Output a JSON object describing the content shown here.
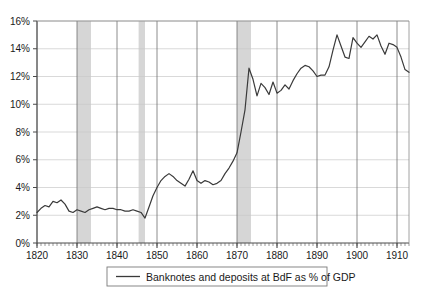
{
  "chart_data": {
    "type": "line",
    "title": "",
    "xlabel": "",
    "ylabel": "",
    "xlim": [
      1820,
      1913
    ],
    "ylim": [
      0,
      16
    ],
    "grid": true,
    "legend_position": "bottom",
    "y_ticks": [
      "0%",
      "2%",
      "4%",
      "6%",
      "8%",
      "10%",
      "12%",
      "14%",
      "16%"
    ],
    "y_tick_values": [
      0,
      2,
      4,
      6,
      8,
      10,
      12,
      14,
      16
    ],
    "x_ticks": [
      "1820",
      "1830",
      "1840",
      "1850",
      "1860",
      "1870",
      "1880",
      "1890",
      "1900",
      "1910"
    ],
    "x_tick_values": [
      1820,
      1830,
      1840,
      1850,
      1860,
      1870,
      1880,
      1890,
      1900,
      1910
    ],
    "x_minor_tick_step": 1,
    "series": [
      {
        "name": "Banknotes and deposits at BdF as % of GDP",
        "color": "#3a3a3a",
        "x": [
          1820,
          1821,
          1822,
          1823,
          1824,
          1825,
          1826,
          1827,
          1828,
          1829,
          1830,
          1831,
          1832,
          1833,
          1834,
          1835,
          1836,
          1837,
          1838,
          1839,
          1840,
          1841,
          1842,
          1843,
          1844,
          1845,
          1846,
          1847,
          1848,
          1849,
          1850,
          1851,
          1852,
          1853,
          1854,
          1855,
          1856,
          1857,
          1858,
          1859,
          1860,
          1861,
          1862,
          1863,
          1864,
          1865,
          1866,
          1867,
          1868,
          1869,
          1870,
          1871,
          1872,
          1873,
          1874,
          1875,
          1876,
          1877,
          1878,
          1879,
          1880,
          1881,
          1882,
          1883,
          1884,
          1885,
          1886,
          1887,
          1888,
          1889,
          1890,
          1891,
          1892,
          1893,
          1894,
          1895,
          1896,
          1897,
          1898,
          1899,
          1900,
          1901,
          1902,
          1903,
          1904,
          1905,
          1906,
          1907,
          1908,
          1909,
          1910,
          1911,
          1912,
          1913
        ],
        "values": [
          2.2,
          2.5,
          2.7,
          2.6,
          3.0,
          2.9,
          3.1,
          2.8,
          2.3,
          2.2,
          2.4,
          2.3,
          2.2,
          2.4,
          2.5,
          2.6,
          2.5,
          2.4,
          2.5,
          2.5,
          2.4,
          2.4,
          2.3,
          2.3,
          2.4,
          2.3,
          2.2,
          1.8,
          2.6,
          3.4,
          4.0,
          4.5,
          4.8,
          5.0,
          4.8,
          4.5,
          4.3,
          4.1,
          4.6,
          5.2,
          4.5,
          4.3,
          4.5,
          4.4,
          4.2,
          4.3,
          4.5,
          5.0,
          5.4,
          5.9,
          6.5,
          8.0,
          9.6,
          12.6,
          11.8,
          10.6,
          11.5,
          11.2,
          10.7,
          11.6,
          10.8,
          11.0,
          11.4,
          11.1,
          11.7,
          12.2,
          12.6,
          12.8,
          12.7,
          12.4,
          12.0,
          12.1,
          12.1,
          12.7,
          13.9,
          15.0,
          14.2,
          13.4,
          13.3,
          14.8,
          14.4,
          14.1,
          14.5,
          14.9,
          14.7,
          15.0,
          14.2,
          13.6,
          14.4,
          14.3,
          14.1,
          13.4,
          12.5,
          12.3
        ]
      }
    ],
    "shaded_bands": [
      {
        "from": 1830.0,
        "to": 1833.5,
        "color": "#d6d6d6"
      },
      {
        "from": 1845.4,
        "to": 1847.0,
        "color": "#d6d6d6"
      },
      {
        "from": 1870.0,
        "to": 1873.5,
        "color": "#d6d6d6"
      }
    ],
    "legend": [
      {
        "label": "Banknotes and deposits at BdF as % of GDP",
        "color": "#3a3a3a",
        "marker": "line"
      }
    ]
  },
  "caption": {
    "text": ""
  }
}
